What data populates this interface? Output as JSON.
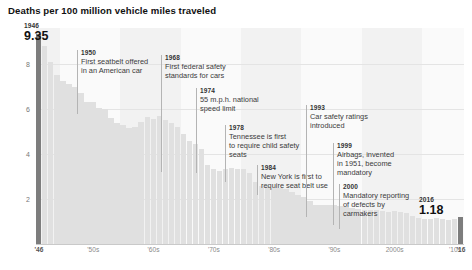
{
  "chart_data": {
    "type": "bar",
    "title": "Deaths per 100 million vehicle miles traveled",
    "xlabel": "",
    "ylabel": "",
    "ylim": [
      0,
      9.6
    ],
    "xlim": [
      1946,
      2016
    ],
    "grid": true,
    "legend": false,
    "yticks": [
      "2",
      "4",
      "6",
      "8"
    ],
    "ytick_values": [
      2,
      4,
      6,
      8
    ],
    "xticks": [
      "'46",
      "'50s",
      "'60s",
      "'70s",
      "'80s",
      "'90s",
      "2000s",
      "'10s",
      "'16"
    ],
    "xtick_years": [
      1946,
      1955,
      1965,
      1975,
      1985,
      1995,
      2005,
      2015,
      2016
    ],
    "categories": [
      1946,
      1947,
      1948,
      1949,
      1950,
      1951,
      1952,
      1953,
      1954,
      1955,
      1956,
      1957,
      1958,
      1959,
      1960,
      1961,
      1962,
      1963,
      1964,
      1965,
      1966,
      1967,
      1968,
      1969,
      1970,
      1971,
      1972,
      1973,
      1974,
      1975,
      1976,
      1977,
      1978,
      1979,
      1980,
      1981,
      1982,
      1983,
      1984,
      1985,
      1986,
      1987,
      1988,
      1989,
      1990,
      1991,
      1992,
      1993,
      1994,
      1995,
      1996,
      1997,
      1998,
      1999,
      2000,
      2001,
      2002,
      2003,
      2004,
      2005,
      2006,
      2007,
      2008,
      2009,
      2010,
      2011,
      2012,
      2013,
      2014,
      2015,
      2016
    ],
    "values": [
      9.35,
      8.8,
      8.1,
      7.5,
      7.24,
      7.1,
      7.0,
      6.7,
      6.3,
      6.3,
      6.05,
      5.98,
      5.6,
      5.4,
      5.31,
      5.16,
      5.21,
      5.41,
      5.63,
      5.54,
      5.7,
      5.5,
      5.4,
      5.21,
      4.88,
      4.57,
      4.43,
      4.24,
      3.53,
      3.35,
      3.25,
      3.35,
      3.39,
      3.34,
      3.35,
      3.17,
      2.76,
      2.58,
      2.57,
      2.47,
      2.51,
      2.45,
      2.32,
      2.17,
      2.08,
      1.91,
      1.75,
      1.75,
      1.73,
      1.73,
      1.69,
      1.64,
      1.58,
      1.55,
      1.53,
      1.51,
      1.51,
      1.48,
      1.44,
      1.46,
      1.42,
      1.36,
      1.26,
      1.15,
      1.11,
      1.1,
      1.14,
      1.1,
      1.08,
      1.13,
      1.18
    ],
    "highlight_years": [
      1946,
      2016
    ],
    "colors": {
      "bar": "#e0e0e0",
      "bar_highlight": "#7d7d7d",
      "band": "#f2f2f2",
      "band_alt": "#fafafa",
      "grid": "#e4e4e4",
      "axis": "#c9c9c9",
      "text": "#3a3a3a",
      "title": "#111111"
    },
    "endpoints": [
      {
        "name": "start",
        "year": "1946",
        "value": "9.35"
      },
      {
        "name": "end",
        "year": "2016",
        "value": "1.18"
      }
    ],
    "annotations": [
      {
        "year": "1950",
        "text": "First seatbelt offered\nin an American car",
        "anchor_year": 1950,
        "x": 77,
        "y": 50,
        "leader_height": 64
      },
      {
        "year": "1968",
        "text": "First federal safety\nstandards for cars",
        "anchor_year": 1968,
        "x": 161,
        "y": 55,
        "leader_height": 117
      },
      {
        "year": "1974",
        "text": "55 m.p.h. national\nspeed limit",
        "anchor_year": 1974,
        "x": 196,
        "y": 88,
        "leader_height": 85
      },
      {
        "year": "1978",
        "text": "Tennessee is first\nto require child safety\nseats",
        "anchor_year": 1978,
        "x": 225,
        "y": 125,
        "leader_height": 57
      },
      {
        "year": "1984",
        "text": "New York is first to\nrequire seat belt use",
        "anchor_year": 1984,
        "x": 257,
        "y": 165,
        "leader_height": 30
      },
      {
        "year": "1993",
        "text": "Car safety ratings\nintroduced",
        "anchor_year": 1993,
        "x": 306,
        "y": 105,
        "leader_height": 112
      },
      {
        "year": "1999",
        "text": "Airbags, invented\nin 1951, become\nmandatory",
        "anchor_year": 1999,
        "x": 333,
        "y": 143,
        "leader_height": 82
      },
      {
        "year": "2000",
        "text": "Mandatory reporting\nof defects by\ncarmakers",
        "anchor_year": 2000,
        "x": 339,
        "y": 184,
        "leader_height": 45
      }
    ],
    "bands": [
      {
        "label": "'46",
        "start_year": 1946,
        "end_year": 1949
      },
      {
        "label": "'50s",
        "start_year": 1950,
        "end_year": 1959
      },
      {
        "label": "'60s",
        "start_year": 1960,
        "end_year": 1969
      },
      {
        "label": "'70s",
        "start_year": 1970,
        "end_year": 1979
      },
      {
        "label": "'80s",
        "start_year": 1980,
        "end_year": 1989
      },
      {
        "label": "'90s",
        "start_year": 1990,
        "end_year": 1999
      },
      {
        "label": "2000s",
        "start_year": 2000,
        "end_year": 2009
      },
      {
        "label": "'10s",
        "start_year": 2010,
        "end_year": 2016
      }
    ]
  }
}
